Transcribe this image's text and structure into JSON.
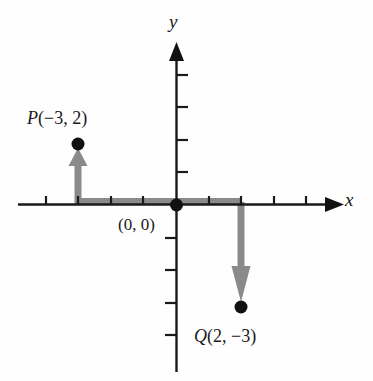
{
  "figure": {
    "background_color": "#fefefe",
    "axis_color": "#1a1a1a",
    "vector_color": "#8a8a8a",
    "point_color": "#111111"
  },
  "axes": {
    "x_label": "x",
    "y_label": "y",
    "origin_label": "(0, 0)",
    "x_axis_y_px": 205,
    "y_axis_x_px": 176,
    "unit_px": 32.5,
    "x_ticks": [
      -4,
      -3,
      -2,
      -1,
      1,
      2,
      3,
      4
    ],
    "y_ticks": [
      -4,
      -3,
      -2,
      -1,
      1,
      2,
      3,
      4
    ],
    "x_range": [
      -4.8,
      5.0
    ],
    "y_range": [
      -5.0,
      4.3
    ],
    "grid": false
  },
  "points": [
    {
      "name": "P",
      "label": "P(−3, 2)",
      "label_name": "P",
      "label_coords": "(−3, 2)",
      "x": -3,
      "y": 2,
      "px": 78,
      "py": 144
    },
    {
      "name": "Q",
      "label": "Q(2, −3)",
      "label_name": "Q",
      "label_coords": "(2, −3)",
      "x": 2,
      "y": -3,
      "px": 241,
      "py": 307
    }
  ],
  "vectors": [
    {
      "name": "horizontal-band",
      "description": "gray horizontal segment from x=-3 to x=2 along the x-axis",
      "from": [
        -3,
        0
      ],
      "to": [
        2,
        0
      ],
      "has_arrowhead": false,
      "color": "#8a8a8a"
    },
    {
      "name": "p-vertical-arrow",
      "description": "gray arrow pointing up from (-3,0) to P(-3,2)",
      "from": [
        -3,
        0
      ],
      "to": [
        -3,
        2
      ],
      "has_arrowhead": true,
      "arrow_direction": "up",
      "color": "#8a8a8a"
    },
    {
      "name": "q-vertical-arrow",
      "description": "gray arrow pointing down from (2,0) to Q(2,-3)",
      "from": [
        2,
        0
      ],
      "to": [
        2,
        -3
      ],
      "has_arrowhead": true,
      "arrow_direction": "down",
      "color": "#8a8a8a"
    }
  ]
}
